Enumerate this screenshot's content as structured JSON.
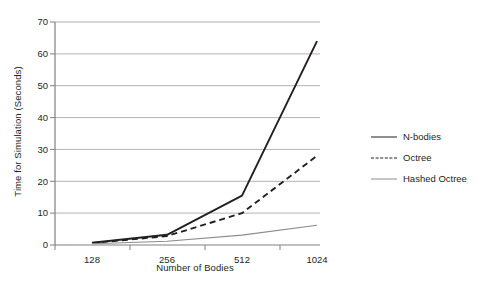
{
  "chart_data": {
    "type": "line",
    "title": "",
    "xlabel": "Number of Bodies",
    "ylabel": "Time for Simulation (Seconds)",
    "categories": [
      "128",
      "256",
      "512",
      "1024"
    ],
    "x_tick_labels": [
      "128",
      "256",
      "512",
      "1024"
    ],
    "y_tick_labels": [
      "0",
      "10",
      "20",
      "30",
      "40",
      "50",
      "60",
      "70"
    ],
    "y_ticks": [
      0,
      10,
      20,
      30,
      40,
      50,
      60,
      70
    ],
    "ylim": [
      0,
      70
    ],
    "grid": "horizontal",
    "legend_position": "right",
    "series": [
      {
        "name": "N-bodies",
        "style": "solid-thick",
        "color": "#231f20",
        "values": [
          0.7,
          3.2,
          15.5,
          64.0
        ]
      },
      {
        "name": "Octree",
        "style": "dashed",
        "color": "#231f20",
        "values": [
          0.6,
          2.8,
          10.0,
          28.0
        ]
      },
      {
        "name": "Hashed Octree",
        "style": "solid-thin",
        "color": "#8c8c8c",
        "values": [
          0.4,
          1.2,
          3.1,
          6.2
        ]
      }
    ]
  },
  "axes": {
    "y_title": "Time for Simulation (Seconds)",
    "x_title": "Number of Bodies"
  },
  "legend": {
    "items": [
      {
        "label": "N-bodies"
      },
      {
        "label": "Octree"
      },
      {
        "label": "Hashed Octree"
      }
    ]
  },
  "colors": {
    "ink": "#231f20",
    "grid": "#b3b3b3",
    "axis": "#808080",
    "thin_series": "#8c8c8c",
    "background": "#ffffff"
  }
}
